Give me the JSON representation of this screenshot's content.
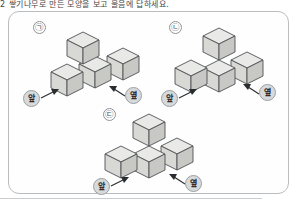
{
  "page": {
    "top_text": "2   쌓기나무로 만든 모양을 보고 물음에 답하세요.",
    "width": 299,
    "height": 206
  },
  "figure": {
    "border_color": "#b9bdc0",
    "background_color": "#fefefe",
    "cube_top_color": "#e9e9e7",
    "cube_left_color": "#d8d8d5",
    "cube_right_color": "#c8c8c5",
    "cube_outline_color": "#4e5154",
    "chip_fill_color": "#d7d9db",
    "arrow_color": "#2a2d30"
  },
  "panels": [
    {
      "tag": "㉠",
      "tag_name": "panel-tag-giyeok",
      "front_label": "앞",
      "side_label": "옆",
      "cube_count": 4,
      "description": "row of three cubes with one cube stacked on the front-left cube"
    },
    {
      "tag": "㉡",
      "tag_name": "panel-tag-nieun",
      "front_label": "앞",
      "side_label": "옆",
      "cube_count": 4,
      "description": "L-shaped base of three cubes with one cube stacked on the back cube"
    },
    {
      "tag": "㉢",
      "tag_name": "panel-tag-digeut",
      "front_label": "앞",
      "side_label": "옆",
      "cube_count": 4,
      "description": "three cubes in an L arrangement with one cube stacked on the back-left cube"
    }
  ]
}
